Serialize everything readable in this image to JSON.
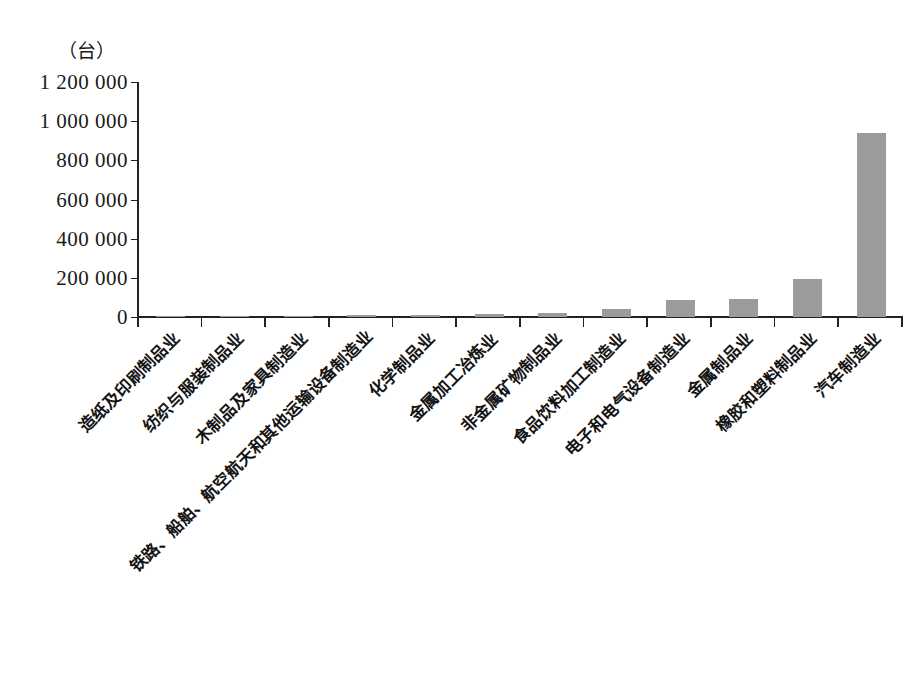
{
  "chart_data": {
    "type": "bar",
    "title": "",
    "subtitle": "",
    "xlabel": "",
    "ylabel": "（台）",
    "unit_label": "（台）",
    "ylim": [
      0,
      1200000
    ],
    "grid": false,
    "legend": null,
    "bar_color": "#9b9b9b",
    "axis_color": "#222222",
    "ytick_labels": [
      "1 200 000",
      "1 000 000",
      "800 000",
      "600 000",
      "400 000",
      "200 000",
      "0"
    ],
    "ytick_values": [
      1200000,
      1000000,
      800000,
      600000,
      400000,
      200000,
      0
    ],
    "categories": [
      "造纸及印刷制品业",
      "纺织与服装制品业",
      "木制品及家具制造业",
      "铁路、船舶、航空航天和其他运输设备制造业",
      "化学制品业",
      "金属加工冶炼业",
      "非金属矿物制品业",
      "食品饮料加工制造业",
      "电子和电气设备制造业",
      "金属制品业",
      "橡胶和塑料制品业",
      "汽车制造业"
    ],
    "values": [
      1000,
      2000,
      3000,
      11000,
      12000,
      14000,
      20000,
      40000,
      85000,
      90000,
      195000,
      940000
    ]
  },
  "caption": {
    "text": ""
  }
}
